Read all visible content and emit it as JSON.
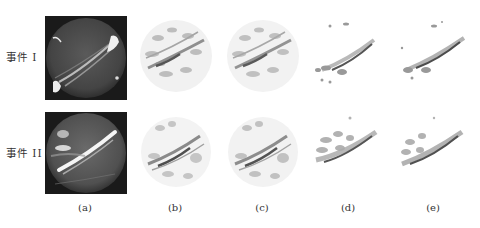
{
  "figure": {
    "rows": [
      {
        "label": "事件 I",
        "label_y": 57,
        "panel_top": 16
      },
      {
        "label": "事件 II",
        "label_y": 152,
        "panel_top": 112
      }
    ],
    "columns": [
      {
        "label": "(a)",
        "center_x": 85,
        "type": "raw all-sky image (dark background)"
      },
      {
        "label": "(b)",
        "center_x": 175,
        "type": "reconstructed (full disk)"
      },
      {
        "label": "(c)",
        "center_x": 262,
        "type": "reconstructed (full disk)"
      },
      {
        "label": "(d)",
        "center_x": 348,
        "type": "reconstructed (arc only)"
      },
      {
        "label": "(e)",
        "center_x": 433,
        "type": "reconstructed (arc only)"
      }
    ],
    "col_label_y": 208,
    "colors": {
      "background": "#ffffff",
      "raw_bg": "#1a1a1a",
      "raw_disk": "#4a4a4a",
      "arc_bright": "#f2f2f2",
      "recon_gray": "#9a9a9a",
      "recon_dark": "#555555",
      "text": "#333333"
    }
  }
}
